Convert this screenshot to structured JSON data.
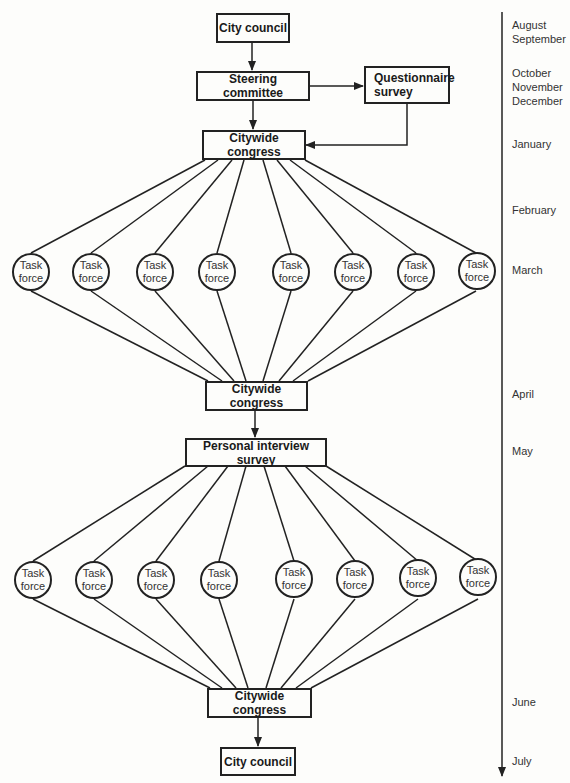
{
  "diagram": {
    "nodes": {
      "city_council_top": "City council",
      "steering_committee": "Steering committee",
      "questionnaire_survey": "Questionnaire\nsurvey",
      "citywide_congress_1": "Citywide congress",
      "citywide_congress_2": "Citywide congress",
      "personal_interview_survey": "Personal interview survey",
      "citywide_congress_3": "Citywide congress",
      "city_council_bottom": "City council"
    },
    "task_force_label": {
      "line1": "Task",
      "line2": "force"
    },
    "task_forces_row1": [
      {
        "line1": "Task",
        "line2": "force"
      },
      {
        "line1": "Task",
        "line2": "force"
      },
      {
        "line1": "Task",
        "line2": "force"
      },
      {
        "line1": "Task",
        "line2": "force"
      },
      {
        "line1": "Task",
        "line2": "force"
      },
      {
        "line1": "Task",
        "line2": "force"
      },
      {
        "line1": "Task",
        "line2": "force"
      },
      {
        "line1": "Task",
        "line2": "force"
      }
    ],
    "task_forces_row2": [
      {
        "line1": "Task",
        "line2": "force"
      },
      {
        "line1": "Task",
        "line2": "force"
      },
      {
        "line1": "Task",
        "line2": "force"
      },
      {
        "line1": "Task",
        "line2": "force"
      },
      {
        "line1": "Task",
        "line2": "force"
      },
      {
        "line1": "Task",
        "line2": "force"
      },
      {
        "line1": "Task",
        "line2": "force"
      },
      {
        "line1": "Task",
        "line2": "force"
      }
    ],
    "edges": [
      [
        "City council",
        "Steering committee"
      ],
      [
        "Steering committee",
        "Questionnaire survey"
      ],
      [
        "Steering committee",
        "Citywide congress"
      ],
      [
        "Questionnaire survey",
        "Citywide congress"
      ],
      [
        "Citywide congress",
        "8 x Task force"
      ],
      [
        "8 x Task force",
        "Citywide congress"
      ],
      [
        "Citywide congress",
        "Personal interview survey"
      ],
      [
        "Personal interview survey",
        "8 x Task force"
      ],
      [
        "8 x Task force",
        "Citywide congress"
      ],
      [
        "Citywide congress",
        "City council"
      ]
    ]
  },
  "timeline": {
    "months": [
      "August\nSeptember",
      "October\nNovember\nDecember",
      "January",
      "February",
      "March",
      "April",
      "May",
      "June",
      "July"
    ]
  }
}
